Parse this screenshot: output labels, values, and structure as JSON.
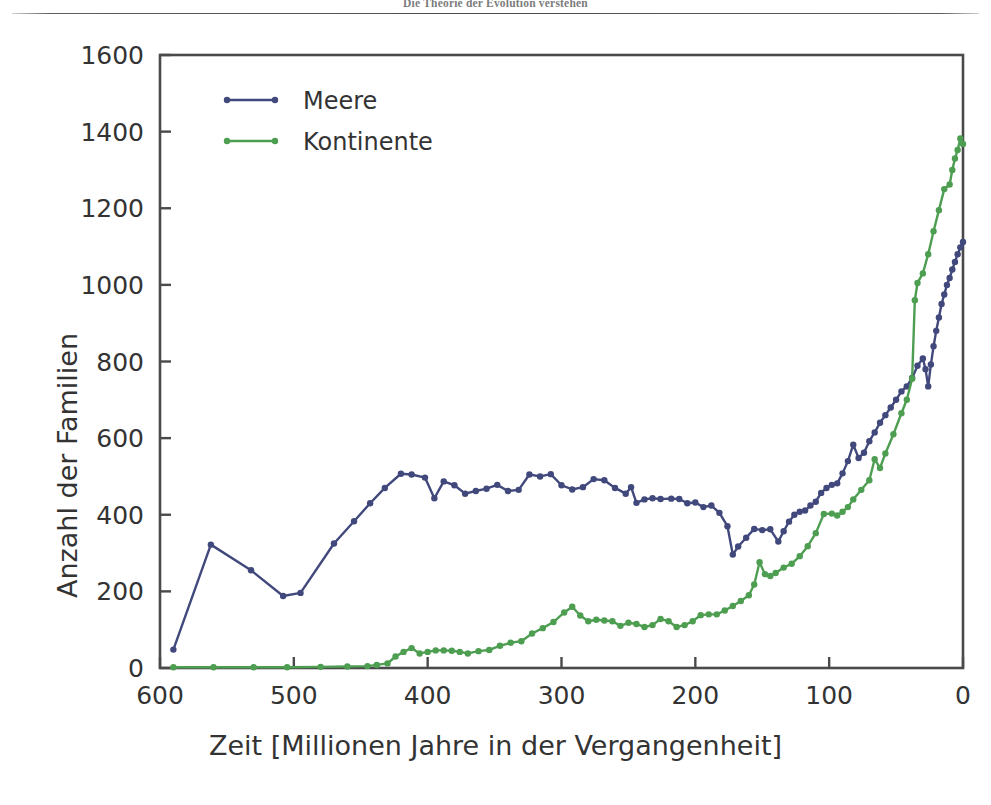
{
  "running_head": "Die Theorie der Evolution verstehen",
  "chart_data": {
    "type": "line",
    "title": "",
    "xlabel": "Zeit [Millionen Jahre in der Vergangenheit]",
    "ylabel": "Anzahl der Familien",
    "xlim": [
      600,
      0
    ],
    "ylim": [
      0,
      1600
    ],
    "x_reversed": true,
    "grid": false,
    "legend_position": "top-left",
    "xticks": [
      600,
      500,
      400,
      300,
      200,
      100,
      0
    ],
    "xtick_labels": [
      "600",
      "500",
      "400",
      "300",
      "200",
      "100",
      "0"
    ],
    "yticks": [
      0,
      200,
      400,
      600,
      800,
      1000,
      1200,
      1400,
      1600
    ],
    "ytick_labels": [
      "0",
      "200",
      "400",
      "600",
      "800",
      "1000",
      "1200",
      "1400",
      "1600"
    ],
    "colors": {
      "meere": "#41497c",
      "kontinente": "#4e9e52",
      "axis": "#4a4a4a",
      "text": "#333333"
    },
    "series": [
      {
        "name": "Meere",
        "color": "#41497c",
        "marker": "circle",
        "points": [
          [
            590,
            48
          ],
          [
            562,
            322
          ],
          [
            532,
            255
          ],
          [
            508,
            188
          ],
          [
            495,
            196
          ],
          [
            470,
            325
          ],
          [
            455,
            383
          ],
          [
            443,
            430
          ],
          [
            432,
            470
          ],
          [
            420,
            507
          ],
          [
            412,
            505
          ],
          [
            402,
            497
          ],
          [
            395,
            443
          ],
          [
            388,
            487
          ],
          [
            380,
            477
          ],
          [
            372,
            455
          ],
          [
            364,
            462
          ],
          [
            356,
            468
          ],
          [
            348,
            478
          ],
          [
            340,
            462
          ],
          [
            332,
            465
          ],
          [
            324,
            505
          ],
          [
            316,
            500
          ],
          [
            308,
            506
          ],
          [
            300,
            477
          ],
          [
            292,
            466
          ],
          [
            284,
            472
          ],
          [
            276,
            493
          ],
          [
            268,
            490
          ],
          [
            260,
            470
          ],
          [
            252,
            455
          ],
          [
            248,
            472
          ],
          [
            244,
            431
          ],
          [
            238,
            440
          ],
          [
            232,
            443
          ],
          [
            226,
            441
          ],
          [
            218,
            442
          ],
          [
            212,
            441
          ],
          [
            206,
            430
          ],
          [
            200,
            432
          ],
          [
            194,
            420
          ],
          [
            188,
            424
          ],
          [
            182,
            405
          ],
          [
            176,
            370
          ],
          [
            172,
            296
          ],
          [
            168,
            317
          ],
          [
            162,
            340
          ],
          [
            156,
            363
          ],
          [
            150,
            360
          ],
          [
            144,
            362
          ],
          [
            138,
            330
          ],
          [
            134,
            357
          ],
          [
            130,
            382
          ],
          [
            126,
            400
          ],
          [
            122,
            408
          ],
          [
            118,
            411
          ],
          [
            114,
            424
          ],
          [
            110,
            434
          ],
          [
            106,
            457
          ],
          [
            102,
            470
          ],
          [
            98,
            478
          ],
          [
            94,
            482
          ],
          [
            90,
            508
          ],
          [
            86,
            540
          ],
          [
            82,
            583
          ],
          [
            78,
            548
          ],
          [
            74,
            562
          ],
          [
            70,
            592
          ],
          [
            66,
            615
          ],
          [
            62,
            640
          ],
          [
            58,
            660
          ],
          [
            54,
            680
          ],
          [
            50,
            700
          ],
          [
            46,
            722
          ],
          [
            42,
            735
          ],
          [
            38,
            757
          ],
          [
            34,
            789
          ],
          [
            30,
            808
          ],
          [
            28,
            780
          ],
          [
            26,
            735
          ],
          [
            24,
            792
          ],
          [
            22,
            840
          ],
          [
            20,
            880
          ],
          [
            18,
            915
          ],
          [
            16,
            950
          ],
          [
            14,
            975
          ],
          [
            12,
            1000
          ],
          [
            10,
            1018
          ],
          [
            8,
            1040
          ],
          [
            6,
            1060
          ],
          [
            4,
            1080
          ],
          [
            2,
            1098
          ],
          [
            0,
            1112
          ]
        ]
      },
      {
        "name": "Kontinente",
        "color": "#4e9e52",
        "marker": "circle",
        "points": [
          [
            590,
            2
          ],
          [
            560,
            2
          ],
          [
            530,
            2
          ],
          [
            505,
            2
          ],
          [
            480,
            3
          ],
          [
            460,
            4
          ],
          [
            445,
            5
          ],
          [
            438,
            8
          ],
          [
            430,
            12
          ],
          [
            424,
            30
          ],
          [
            418,
            42
          ],
          [
            412,
            52
          ],
          [
            406,
            38
          ],
          [
            400,
            42
          ],
          [
            394,
            46
          ],
          [
            388,
            46
          ],
          [
            382,
            45
          ],
          [
            376,
            42
          ],
          [
            370,
            38
          ],
          [
            362,
            44
          ],
          [
            354,
            47
          ],
          [
            346,
            58
          ],
          [
            338,
            66
          ],
          [
            330,
            70
          ],
          [
            322,
            90
          ],
          [
            314,
            104
          ],
          [
            306,
            120
          ],
          [
            298,
            145
          ],
          [
            292,
            160
          ],
          [
            286,
            137
          ],
          [
            280,
            122
          ],
          [
            274,
            126
          ],
          [
            268,
            124
          ],
          [
            262,
            122
          ],
          [
            256,
            110
          ],
          [
            250,
            118
          ],
          [
            244,
            115
          ],
          [
            238,
            107
          ],
          [
            232,
            112
          ],
          [
            226,
            128
          ],
          [
            220,
            122
          ],
          [
            214,
            107
          ],
          [
            208,
            112
          ],
          [
            202,
            122
          ],
          [
            196,
            138
          ],
          [
            190,
            140
          ],
          [
            184,
            140
          ],
          [
            178,
            150
          ],
          [
            172,
            162
          ],
          [
            166,
            175
          ],
          [
            160,
            190
          ],
          [
            156,
            218
          ],
          [
            152,
            276
          ],
          [
            148,
            245
          ],
          [
            144,
            240
          ],
          [
            140,
            248
          ],
          [
            134,
            262
          ],
          [
            128,
            272
          ],
          [
            122,
            292
          ],
          [
            116,
            318
          ],
          [
            110,
            352
          ],
          [
            104,
            402
          ],
          [
            98,
            403
          ],
          [
            94,
            398
          ],
          [
            90,
            408
          ],
          [
            86,
            420
          ],
          [
            82,
            440
          ],
          [
            76,
            465
          ],
          [
            70,
            490
          ],
          [
            66,
            545
          ],
          [
            62,
            522
          ],
          [
            58,
            560
          ],
          [
            52,
            610
          ],
          [
            46,
            665
          ],
          [
            42,
            700
          ],
          [
            38,
            755
          ],
          [
            36,
            960
          ],
          [
            34,
            1005
          ],
          [
            30,
            1030
          ],
          [
            26,
            1080
          ],
          [
            22,
            1140
          ],
          [
            18,
            1195
          ],
          [
            14,
            1250
          ],
          [
            10,
            1262
          ],
          [
            8,
            1300
          ],
          [
            6,
            1330
          ],
          [
            4,
            1352
          ],
          [
            2,
            1382
          ],
          [
            0,
            1368
          ]
        ]
      }
    ]
  },
  "legend": {
    "items": [
      {
        "label": "Meere",
        "color": "#41497c"
      },
      {
        "label": "Kontinente",
        "color": "#4e9e52"
      }
    ]
  }
}
